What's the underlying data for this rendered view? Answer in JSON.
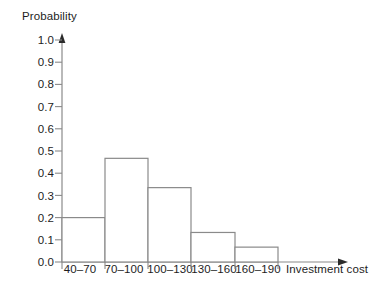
{
  "chart_data": {
    "type": "bar",
    "title": "",
    "subtitle": "",
    "xlabel": "Investment cost",
    "ylabel": "Probability",
    "categories": [
      "40–70",
      "70–100",
      "100–130",
      "130–160",
      "160–190"
    ],
    "values": [
      0.2,
      0.467,
      0.335,
      0.133,
      0.067
    ],
    "ylim": [
      0.0,
      1.0
    ],
    "ytick_labels": [
      "0.0",
      "0.1",
      "0.2",
      "0.3",
      "0.4",
      "0.5",
      "0.6",
      "0.7",
      "0.8",
      "0.9",
      "1.0"
    ],
    "ytick_values": [
      0.0,
      0.1,
      0.2,
      0.3,
      0.4,
      0.5,
      0.6,
      0.7,
      0.8,
      0.9,
      1.0
    ],
    "grid": false,
    "legend": null,
    "bar_style": {
      "fill": "#ffffff",
      "stroke": "#8a8a8a"
    },
    "axis_color": "#8a8a8a",
    "text_color": "#1d1d1d",
    "background": "#ffffff"
  }
}
